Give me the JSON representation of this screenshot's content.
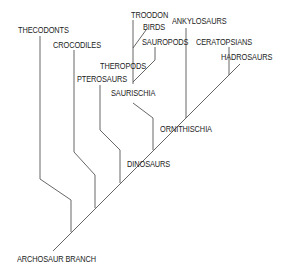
{
  "diagram": {
    "line_color": "#555555",
    "text_color": "#222222",
    "labels": {
      "thecodonts": "THECODONTS",
      "crocodiles": "CROCODILES",
      "pterosaurs": "PTEROSAURS",
      "troodon": "TROODON",
      "birds": "BIRDS",
      "sauropods": "SAUROPODS",
      "theropods": "THEROPODS",
      "saurischia": "SAURISCHIA",
      "ankylosaurs": "ANKYLOSAURS",
      "ceratopsians": "CERATOPSIANS",
      "hadrosaurs": "HADROSAURS",
      "ornithischia": "ORNITHISCHIA",
      "dinosaurs": "DINOSAURS",
      "archosaur_branch": "ARCHOSAUR BRANCH"
    },
    "tree": {
      "root": "ARCHOSAUR BRANCH",
      "children": [
        "THECODONTS",
        "CROCODILES",
        "PTEROSAURS",
        {
          "node": "DINOSAURS",
          "children": [
            {
              "node": "SAURISCHIA",
              "children": [
                {
                  "node": "THEROPODS",
                  "children": [
                    "TROODON",
                    "BIRDS"
                  ]
                },
                "SAUROPODS"
              ]
            },
            {
              "node": "ORNITHISCHIA",
              "children": [
                "ANKYLOSAURS",
                "CERATOPSIANS",
                "HADROSAURS"
              ]
            }
          ]
        }
      ]
    }
  }
}
